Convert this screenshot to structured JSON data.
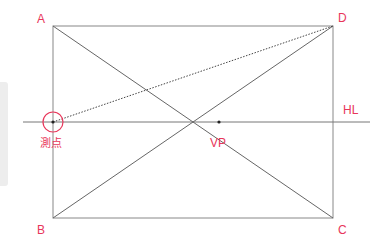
{
  "diagram": {
    "title": "",
    "accent_color": "#e8365a",
    "line_color": "#777777",
    "points": {
      "A": {
        "label": "A",
        "x": 53,
        "y": 26
      },
      "B": {
        "label": "B",
        "x": 53,
        "y": 218
      },
      "C": {
        "label": "C",
        "x": 333,
        "y": 218
      },
      "D": {
        "label": "D",
        "x": 333,
        "y": 26
      },
      "VP": {
        "label": "VP",
        "x": 219,
        "y": 122
      },
      "measure_point": {
        "label": "測点",
        "x": 53,
        "y": 122
      }
    },
    "horizon_line": {
      "label": "HL",
      "y": 122,
      "x_start": 23,
      "x_end": 370
    }
  }
}
